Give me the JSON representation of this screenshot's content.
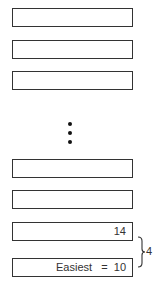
{
  "diagram": {
    "boxes": [
      {
        "label": ""
      },
      {
        "label": ""
      },
      {
        "label": ""
      },
      {
        "label": ""
      },
      {
        "label": ""
      },
      {
        "label": "14"
      },
      {
        "label": "Easiest   =  10"
      }
    ],
    "ellipsis": "vertical-dots",
    "brace": {
      "spans": [
        "14",
        "Easiest = 10"
      ],
      "label": "4"
    },
    "colors": {
      "stroke": "#333333",
      "background": "#ffffff"
    }
  }
}
